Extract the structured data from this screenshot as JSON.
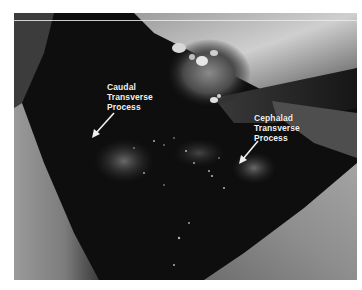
{
  "figure": {
    "type": "intraoperative photograph",
    "colors": {
      "background": "#ffffff",
      "cavity": "#0d0d0d",
      "tissue_light": "#b8b8b8",
      "tissue_mid": "#7a7a7a",
      "label_text": "#f2f2f2"
    },
    "annotations": [
      {
        "id": "caudal",
        "lines": [
          "Caudal",
          "Transverse",
          "Process"
        ],
        "arrow_direction": "down-left"
      },
      {
        "id": "cephalad",
        "lines": [
          "Cephalad",
          "Transverse",
          "Process"
        ],
        "arrow_direction": "down-left"
      }
    ]
  }
}
